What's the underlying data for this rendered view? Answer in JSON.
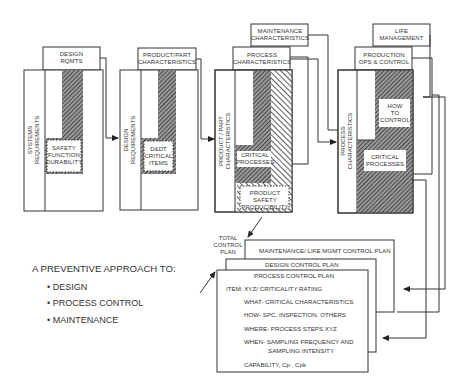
{
  "diagram": {
    "stages": [
      {
        "header": "DESIGN\nRQMTS",
        "side_label": "SYSTEMS\nREQUIREMENTS",
        "inner_box": "SAFETY\nFUNCTION\nDURABILITY"
      },
      {
        "header": "PRODUCT/PART\nCHARACTERISTICS",
        "side_label": "DESIGN\nREQUIREMENTS",
        "inner_box": "D&DT\nCRITICAL\nITEMS"
      },
      {
        "top_header": "MAINTENANCE\nCHARACTERISTICS",
        "header": "PROCESS\nCHARACTERISTICS",
        "side_label": "PRODUCT / PART\nCHARACTERISTICS",
        "inner_box": "CRITICAL\nPROCESSES",
        "bottom_box": "PRODUCT SAFETY\nPRODUCIBILITY"
      },
      {
        "top_header": "LIFE\nMANAGEMENT",
        "header": "PRODUCTION\nOPS & CONTROL",
        "side_label": "PROCESS\nCHARACTERISTICS",
        "inner_box_top": "HOW\nTO\nCONTROL",
        "inner_box": "CRITICAL\nPROCESSES"
      }
    ],
    "total_control_plan_label": "TOTAL\nCONTROL\nPLAN",
    "plans": {
      "maintenance": "MAINTENANCE/ LIFE MGMT CONTROL PLAN",
      "design": "DESIGN CONTROL PLAN",
      "process": "PROCESS CONTROL PLAN"
    },
    "process_plan_items": [
      "ITEM: XYZ/ CRITICALITY RATING",
      "WHAT- CRITICAL CHARACTERISTICS",
      "HOW- SPC, INSPECTION, OTHERS",
      "WHERE- PROCESS STEPS XYZ",
      "WHEN- SAMPLING FREQUENCY AND",
      "SAMPLING INTENSITY",
      "CAPABILITY, Cp , Cpk"
    ],
    "approach": {
      "title": "A PREVENTIVE APPROACH TO:",
      "bullets": [
        "• DESIGN",
        "• PROCESS CONTROL",
        "• MAINTENANCE"
      ]
    }
  }
}
